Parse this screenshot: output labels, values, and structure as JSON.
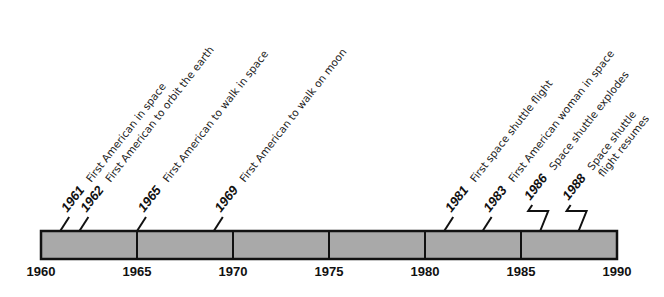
{
  "timeline": {
    "start_year": 1960,
    "end_year": 1990,
    "bar_color": "#a9a9a9",
    "border_color": "#111111",
    "axis_ticks": [
      {
        "year": 1960,
        "label": "1960"
      },
      {
        "year": 1965,
        "label": "1965"
      },
      {
        "year": 1970,
        "label": "1970"
      },
      {
        "year": 1975,
        "label": "1975"
      },
      {
        "year": 1980,
        "label": "1980"
      },
      {
        "year": 1985,
        "label": "1985"
      },
      {
        "year": 1990,
        "label": "1990"
      }
    ],
    "events": [
      {
        "year": 1961,
        "year_label": "1961",
        "lines": [
          "First American in space"
        ],
        "connector": "straight"
      },
      {
        "year": 1962,
        "year_label": "1962",
        "lines": [
          "First American to orbit the earth"
        ],
        "connector": "straight"
      },
      {
        "year": 1965,
        "year_label": "1965",
        "lines": [
          "First American to walk in space"
        ],
        "connector": "straight"
      },
      {
        "year": 1969,
        "year_label": "1969",
        "lines": [
          "First American to walk on moon"
        ],
        "connector": "straight"
      },
      {
        "year": 1981,
        "year_label": "1981",
        "lines": [
          "First space shuttle flight"
        ],
        "connector": "straight"
      },
      {
        "year": 1983,
        "year_label": "1983",
        "lines": [
          "First American woman in space"
        ],
        "connector": "straight"
      },
      {
        "year": 1986,
        "year_label": "1986",
        "lines": [
          "Space shuttle explodes"
        ],
        "connector": "zigzag"
      },
      {
        "year": 1988,
        "year_label": "1988",
        "lines": [
          "Space shuttle",
          "flight resumes"
        ],
        "connector": "zigzag"
      }
    ]
  },
  "chart_data": {
    "type": "timeline",
    "title": "",
    "x_range": [
      1960,
      1990
    ],
    "tick_labels": [
      "1960",
      "1965",
      "1970",
      "1975",
      "1980",
      "1985",
      "1990"
    ],
    "events": [
      {
        "year": 1961,
        "label": "First American in space"
      },
      {
        "year": 1962,
        "label": "First American to orbit the earth"
      },
      {
        "year": 1965,
        "label": "First American to walk in space"
      },
      {
        "year": 1969,
        "label": "First American to walk on moon"
      },
      {
        "year": 1981,
        "label": "First space shuttle flight"
      },
      {
        "year": 1983,
        "label": "First American woman in space"
      },
      {
        "year": 1986,
        "label": "Space shuttle explodes"
      },
      {
        "year": 1988,
        "label": "Space shuttle flight resumes"
      }
    ]
  }
}
